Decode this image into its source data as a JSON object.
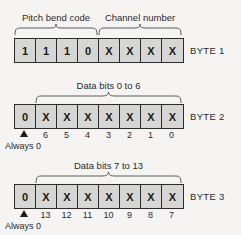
{
  "diagram": {
    "title_semantic": "midi-pitch-bend-message-format",
    "background_color": "#f5f4f2",
    "cell_fill_color": "#d6d6d4",
    "cell_border_color": "#2b2b2b",
    "marker_color": "#1b1b1b",
    "bytes": [
      {
        "id": "byte1",
        "label": "BYTE 1",
        "cells": [
          "1",
          "1",
          "1",
          "0",
          "X",
          "X",
          "X",
          "X"
        ],
        "braces": [
          {
            "label": "Pitch bend code",
            "start_cell": 0,
            "end_cell": 3
          },
          {
            "label": "Channel number",
            "start_cell": 4,
            "end_cell": 7
          }
        ],
        "bit_numbers": [],
        "always_zero": null
      },
      {
        "id": "byte2",
        "label": "BYTE 2",
        "cells": [
          "0",
          "X",
          "X",
          "X",
          "X",
          "X",
          "X",
          "X"
        ],
        "braces": [
          {
            "label": "Data bits 0 to 6",
            "start_cell": 1,
            "end_cell": 7
          }
        ],
        "bit_numbers": [
          "6",
          "5",
          "4",
          "3",
          "2",
          "1",
          "0"
        ],
        "always_zero": "Always 0"
      },
      {
        "id": "byte3",
        "label": "BYTE 3",
        "cells": [
          "0",
          "X",
          "X",
          "X",
          "X",
          "X",
          "X",
          "X"
        ],
        "braces": [
          {
            "label": "Data bits 7 to 13",
            "start_cell": 1,
            "end_cell": 7
          }
        ],
        "bit_numbers": [
          "13",
          "12",
          "11",
          "10",
          "9",
          "8",
          "7"
        ],
        "always_zero": "Always 0"
      }
    ]
  }
}
